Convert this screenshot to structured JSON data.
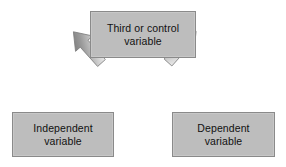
{
  "diagram": {
    "background_color": "#ffffff",
    "box_fill_color": "#bdbdbd",
    "box_border_color": "#8a8a8a",
    "text_color": "#111111",
    "arrow_light_color": "#f2f2f2",
    "arrow_dark_color": "#6e6e6e",
    "nodes": [
      {
        "id": "third-or-control",
        "label": "Third or control\nvariable",
        "line1": "Third or control",
        "line2": "variable",
        "role": "top"
      },
      {
        "id": "independent",
        "label": "Independent\nvariable",
        "line1": "Independent",
        "line2": "variable",
        "role": "bottom-left"
      },
      {
        "id": "dependent",
        "label": "Dependent\nvariable",
        "line1": "Dependent",
        "line2": "variable",
        "role": "bottom-right"
      }
    ],
    "arrows": [
      {
        "id": "arrow-to-independent",
        "from": "third-or-control",
        "to": "independent",
        "direction": "down-left",
        "style": "block-arrow-gradient"
      },
      {
        "id": "arrow-to-dependent",
        "from": "third-or-control",
        "to": "dependent",
        "direction": "down-right",
        "style": "block-arrow-gradient"
      }
    ]
  }
}
